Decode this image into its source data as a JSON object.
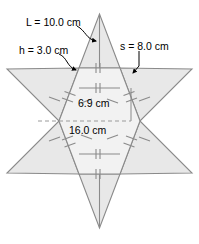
{
  "figure": {
    "shape": "six-pointed-star",
    "fill_color": "#e8e8e8",
    "stroke_color": "#8a8a8a",
    "text_color": "#000000",
    "dashed_color": "#9a9a9a"
  },
  "labels": {
    "slant_height": "L = 10.0 cm",
    "apothem": "h = 3.0 cm",
    "side": "s = 8.0 cm",
    "inner_width": "6.9 cm",
    "outer_width": "16.0 cm"
  },
  "measurements": [
    {
      "name": "L",
      "value": 10.0,
      "unit": "cm",
      "meaning": "triangle slant side"
    },
    {
      "name": "h",
      "value": 3.0,
      "unit": "cm",
      "meaning": "hexagon apothem"
    },
    {
      "name": "s",
      "value": 8.0,
      "unit": "cm",
      "meaning": "triangle base / hexagon side"
    },
    {
      "name": "inner",
      "value": 6.9,
      "unit": "cm",
      "meaning": "hexagon height across flats"
    },
    {
      "name": "outer",
      "value": 16.0,
      "unit": "cm",
      "meaning": "star width across points"
    }
  ],
  "tick_marks": {
    "hexagon_edges": 2,
    "triangle_edges": 1
  }
}
